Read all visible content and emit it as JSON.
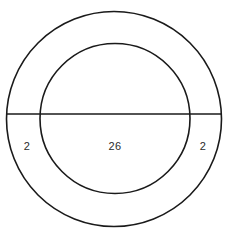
{
  "figure": {
    "kind": "annulus-with-diameter",
    "background_color": "#ffffff",
    "stroke_color": "#1a1a1a",
    "text_color": "#2b2b2b",
    "outer_circle": {
      "name": "outer-circle",
      "center_x": 114,
      "center_y": 119,
      "radius": 107.5
    },
    "inner_circle": {
      "name": "inner-circle",
      "center_x": 115,
      "center_y": 118.5,
      "radius": 75
    },
    "chord": {
      "name": "horizontal-diameter",
      "x1": 6.5,
      "x2": 221.5,
      "y": 114
    },
    "labels": [
      {
        "id": "left-ring-width",
        "text": "2",
        "x": 27,
        "y": 146
      },
      {
        "id": "inner-diameter",
        "text": "26",
        "x": 115,
        "y": 146
      },
      {
        "id": "right-ring-width",
        "text": "2",
        "x": 203,
        "y": 146
      }
    ]
  },
  "chart_data": {
    "type": "diagram",
    "title": "",
    "shapes": [
      {
        "shape": "circle",
        "role": "outer boundary",
        "center": [
          114,
          119
        ],
        "radius_px": 107.5
      },
      {
        "shape": "circle",
        "role": "inner boundary",
        "center": [
          115,
          118.5
        ],
        "radius_px": 75
      },
      {
        "shape": "line",
        "role": "horizontal diameter of outer circle",
        "from": [
          6.5,
          114
        ],
        "to": [
          221.5,
          114
        ]
      }
    ],
    "annotations": [
      {
        "label": "2",
        "measures": "left ring thickness",
        "position": [
          27,
          146
        ]
      },
      {
        "label": "26",
        "measures": "inner circle diameter",
        "position": [
          115,
          146
        ]
      },
      {
        "label": "2",
        "measures": "right ring thickness",
        "position": [
          203,
          146
        ]
      }
    ],
    "values": [
      2,
      26,
      2
    ],
    "categories": [
      "left ring thickness",
      "inner diameter",
      "right ring thickness"
    ],
    "derived": {
      "outer_diameter": 30,
      "units": ""
    }
  }
}
